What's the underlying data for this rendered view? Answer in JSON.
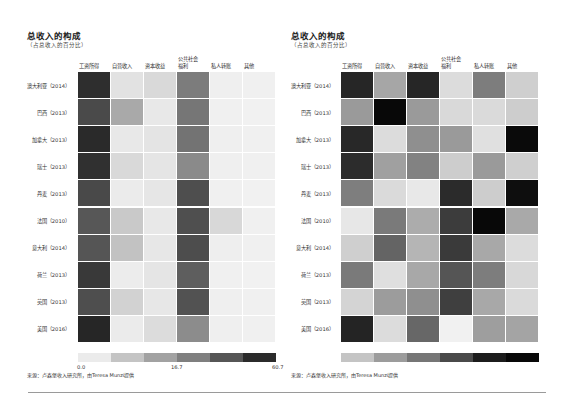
{
  "chart_data": [
    {
      "type": "heatmap",
      "title": "总收入的构成",
      "subtitle": "（占总收入的百分比）",
      "columns": [
        "工资所得",
        "自营收入",
        "资本收益",
        "公共社会福利",
        "私人转账",
        "其他"
      ],
      "column_labels_display": [
        [
          "工资所得"
        ],
        [
          "自营收入"
        ],
        [
          "资本收益"
        ],
        [
          "公共社会",
          "福利"
        ],
        [
          "私人转账"
        ],
        [
          "其他"
        ]
      ],
      "rows": [
        "澳大利亚（2014）",
        "巴西（2013）",
        "加拿大（2013）",
        "瑞士（2013）",
        "丹麦（2013）",
        "法国（2010）",
        "意大利（2014）",
        "荷兰（2013）",
        "英国（2013）",
        "美国（2016）"
      ],
      "scale": "shared absolute, 0.0 – 60.7",
      "colorbar": {
        "ticks": [
          "0.0",
          "16.7",
          "60.7"
        ],
        "colors": [
          "#ebebeb",
          "#c4c4c4",
          "#a2a2a2",
          "#7f7f7f",
          "#565656",
          "#2b2b2b"
        ]
      },
      "cell_colors": [
        [
          "#2e2e2e",
          "#e2e2e2",
          "#d9d9d9",
          "#7c7c7c",
          "#efefef",
          "#f0f0f0"
        ],
        [
          "#4a4a4a",
          "#a9a9a9",
          "#e8e8e8",
          "#767676",
          "#f0f0f0",
          "#f1f1f1"
        ],
        [
          "#2a2a2a",
          "#e8e8e8",
          "#e4e4e4",
          "#737373",
          "#efefef",
          "#f0f0f0"
        ],
        [
          "#303030",
          "#d9d9d9",
          "#e5e5e5",
          "#8a8a8a",
          "#efefef",
          "#f0f0f0"
        ],
        [
          "#494949",
          "#ebebeb",
          "#e6e6e6",
          "#4e4e4e",
          "#f0f0f0",
          "#f1f1f1"
        ],
        [
          "#575757",
          "#c9c9c9",
          "#e8e8e8",
          "#4f4f4f",
          "#d8d8d8",
          "#f0f0f0"
        ],
        [
          "#555555",
          "#c2c2c2",
          "#e7e7e7",
          "#4d4d4d",
          "#eeeeee",
          "#f0f0f0"
        ],
        [
          "#393939",
          "#ececec",
          "#e5e5e5",
          "#5e5e5e",
          "#f0f0f0",
          "#f1f1f1"
        ],
        [
          "#4e4e4e",
          "#d2d2d2",
          "#e7e7e7",
          "#525252",
          "#efefef",
          "#f0f0f0"
        ],
        [
          "#262626",
          "#ebebeb",
          "#dcdcdc",
          "#8c8c8c",
          "#efefef",
          "#f0f0f0"
        ]
      ],
      "approx_values_pct": [
        [
          58,
          8,
          10,
          22,
          1,
          1
        ],
        [
          50,
          18,
          3,
          26,
          1,
          1
        ],
        [
          60,
          4,
          5,
          27,
          1,
          1
        ],
        [
          57,
          8,
          5,
          22,
          1,
          1
        ],
        [
          50,
          3,
          4,
          44,
          1,
          1
        ],
        [
          47,
          10,
          3,
          43,
          6,
          1
        ],
        [
          47,
          12,
          4,
          45,
          1,
          1
        ],
        [
          55,
          3,
          5,
          37,
          1,
          1
        ],
        [
          49,
          9,
          4,
          42,
          1,
          1
        ],
        [
          61,
          4,
          8,
          21,
          1,
          1
        ]
      ],
      "source": "来源：卢森堡收入研究所，由Teresa Munzi提供"
    },
    {
      "type": "heatmap",
      "title": "总收入的构成",
      "subtitle": "（占总收入的百分比）",
      "columns": [
        "工资所得",
        "自营收入",
        "资本收益",
        "公共社会福利",
        "私人转账",
        "其他"
      ],
      "column_labels_display": [
        [
          "工资所得"
        ],
        [
          "自营收入"
        ],
        [
          "资本收益"
        ],
        [
          "公共社会",
          "福利"
        ],
        [
          "私人转账"
        ],
        [
          "其他"
        ]
      ],
      "rows": [
        "澳大利亚（2014）",
        "巴西（2013）",
        "加拿大（2013）",
        "瑞士（2013）",
        "丹麦（2013）",
        "法国（2010）",
        "意大利（2014）",
        "荷兰（2013）",
        "英国（2013）",
        "美国（2016）"
      ],
      "scale": "column-normalized (relative within each income type)",
      "colorbar": {
        "ticks": [],
        "colors": [
          "#c4c4c4",
          "#9c9c9c",
          "#767676",
          "#4a4a4a",
          "#1c1c1c",
          "#080808"
        ]
      },
      "cell_colors": [
        [
          "#262626",
          "#a6a6a6",
          "#262626",
          "#dcdcdc",
          "#7d7d7d",
          "#cfcfcf"
        ],
        [
          "#9a9a9a",
          "#080808",
          "#9a9a9a",
          "#d9d9d9",
          "#dadada",
          "#cdcdcd"
        ],
        [
          "#282828",
          "#dcdcdc",
          "#8f8f8f",
          "#9a9a9a",
          "#e0e0e0",
          "#0a0a0a"
        ],
        [
          "#2c2c2c",
          "#a0a0a0",
          "#828282",
          "#cdcdcd",
          "#9a9a9a",
          "#cfcfcf"
        ],
        [
          "#7e7e7e",
          "#dadada",
          "#e8e8e8",
          "#2b2b2b",
          "#cdcdcd",
          "#0e0e0e"
        ],
        [
          "#e7e7e7",
          "#7a7a7a",
          "#acacac",
          "#3c3c3c",
          "#080808",
          "#a9a9a9"
        ],
        [
          "#cfcfcf",
          "#646464",
          "#b5b5b5",
          "#3a3a3a",
          "#a8a8a8",
          "#dcdcdc"
        ],
        [
          "#7a7a7a",
          "#dfdfdf",
          "#a8a8a8",
          "#555555",
          "#7d7d7d",
          "#d8d8d8"
        ],
        [
          "#d4d4d4",
          "#9c9c9c",
          "#8f8f8f",
          "#3f3f3f",
          "#a8a8a8",
          "#dadada"
        ],
        [
          "#242424",
          "#dcdcdc",
          "#676767",
          "#f1f1f1",
          "#9e9e9e",
          "#a4a4a4"
        ]
      ],
      "source": "来源：卢森堡收入研究所，由Teresa Munzi提供"
    }
  ]
}
